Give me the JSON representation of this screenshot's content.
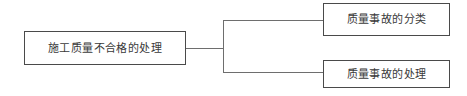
{
  "diagram": {
    "type": "tree-flowchart",
    "orientation": "horizontal-left-to-right",
    "background_color": "#ffffff",
    "border_color": "#4a4a4a",
    "connector_color": "#6e6e6e",
    "text_color": "#3a3a3a",
    "root": {
      "label": "施工质量不合格的处理"
    },
    "children": [
      {
        "label": "质量事故的分类"
      },
      {
        "label": "质量事故的处理"
      }
    ]
  }
}
